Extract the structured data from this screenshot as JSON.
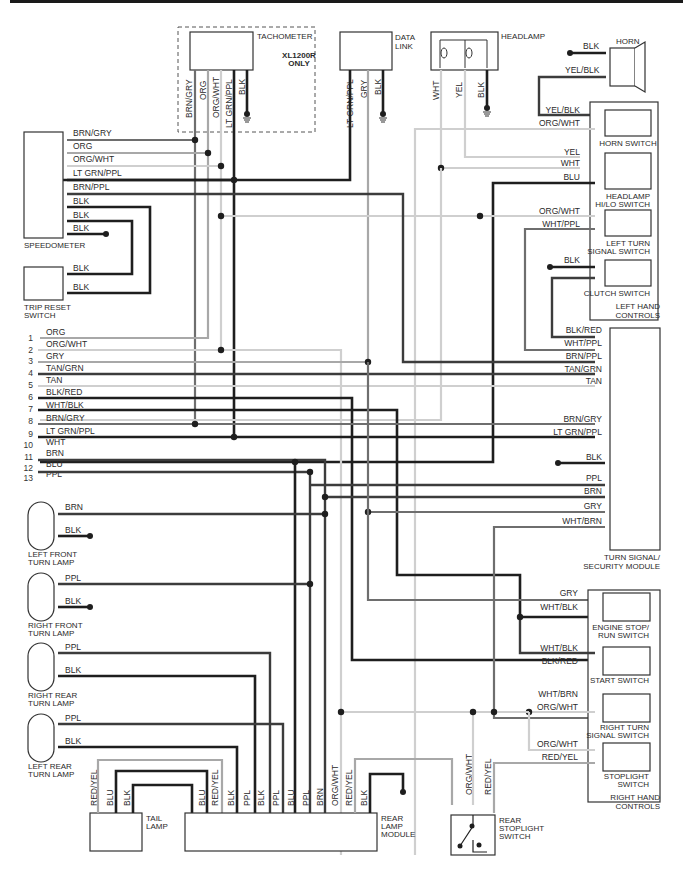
{
  "diagram": {
    "colors": {
      "black": "#1e1e1e",
      "dark": "#3c3c3c",
      "medium": "#6e6e6e",
      "light": "#a8a8a8",
      "xlight": "#cfcfcf"
    },
    "components": {
      "tachometer": "TACHOMETER",
      "xl_note_1": "XL1200R",
      "xl_note_2": "ONLY",
      "data_link_1": "DATA",
      "data_link_2": "LINK",
      "headlamp": "HEADLAMP",
      "horn": "HORN",
      "speedometer": "SPEEDOMETER",
      "trip_reset_1": "TRIP RESET",
      "trip_reset_2": "SWITCH",
      "horn_switch": "HORN SWITCH",
      "hilo_1": "HEADLAMP",
      "hilo_2": "HI/LO SWITCH",
      "left_turn_1": "LEFT TURN",
      "left_turn_2": "SIGNAL SWITCH",
      "clutch": "CLUTCH SWITCH",
      "lhc_1": "LEFT HAND",
      "lhc_2": "CONTROLS",
      "tssm_1": "TURN SIGNAL/",
      "tssm_2": "SECURITY MODULE",
      "engine_stop_1": "ENGINE STOP/",
      "engine_stop_2": "RUN SWITCH",
      "start": "START SWITCH",
      "right_turn_1": "RIGHT TURN",
      "right_turn_2": "SIGNAL SWITCH",
      "stoplight_1": "STOPLIGHT",
      "stoplight_2": "SWITCH",
      "rhc_1": "RIGHT HAND",
      "rhc_2": "CONTROLS",
      "lf_turn_1": "LEFT FRONT",
      "lf_turn_2": "TURN LAMP",
      "rf_turn_1": "RIGHT FRONT",
      "rf_turn_2": "TURN LAMP",
      "rr_turn_1": "RIGHT REAR",
      "rr_turn_2": "TURN LAMP",
      "lr_turn_1": "LEFT REAR",
      "lr_turn_2": "TURN LAMP",
      "tail_1": "TAIL",
      "tail_2": "LAMP",
      "rlm_1": "REAR",
      "rlm_2": "LAMP",
      "rlm_3": "MODULE",
      "rss_1": "REAR",
      "rss_2": "STOPLIGHT",
      "rss_3": "SWITCH"
    },
    "tachometer_pins": [
      "BRN/GRY",
      "ORG",
      "ORG/WHT",
      "LT GRN/PPL",
      "BLK"
    ],
    "data_link_pins": [
      "LT GRN/PPL",
      "GRY",
      "BLK"
    ],
    "headlamp_pins": [
      "WHT",
      "YEL",
      "BLK"
    ],
    "horn_pins": [
      "BLK",
      "YEL/BLK"
    ],
    "speedometer_wires": [
      "BRN/GRY",
      "ORG",
      "ORG/WHT",
      "LT GRN/PPL",
      "BRN/PPL",
      "BLK",
      "BLK",
      "BLK"
    ],
    "trip_reset_wires": [
      "BLK",
      "BLK"
    ],
    "left_hand_controls_wires": [
      "YEL/BLK",
      "ORG/WHT",
      "YEL",
      "WHT",
      "BLU",
      "ORG/WHT",
      "WHT/PPL",
      "BLK"
    ],
    "connector_rows": [
      {
        "num": "1",
        "color": "ORG"
      },
      {
        "num": "2",
        "color": "ORG/WHT"
      },
      {
        "num": "3",
        "color": "GRY"
      },
      {
        "num": "4",
        "color": "TAN/GRN"
      },
      {
        "num": "5",
        "color": "TAN"
      },
      {
        "num": "6",
        "color": "BLK/RED"
      },
      {
        "num": "7",
        "color": "WHT/BLK"
      },
      {
        "num": "8",
        "color": "BRN/GRY"
      },
      {
        "num": "9",
        "color": "LT GRN/PPL"
      },
      {
        "num": "10",
        "color": "WHT"
      },
      {
        "num": "11",
        "color": "BRN"
      },
      {
        "num": "12",
        "color": "BLU"
      },
      {
        "num": "13",
        "color": "PPL"
      }
    ],
    "tssm_wires": [
      "BLK/RED",
      "WHT/PPL",
      "BRN/PPL",
      "TAN/GRN",
      "TAN",
      "BRN/GRY",
      "LT GRN/PPL",
      "BLK",
      "PPL",
      "BRN",
      "GRY",
      "WHT/BRN"
    ],
    "right_hand_controls_wires": [
      "GRY",
      "WHT/BLK",
      "WHT/BLK",
      "BLK/RED",
      "WHT/BRN",
      "ORG/WHT",
      "ORG/WHT",
      "RED/YEL"
    ],
    "turn_lamp_wires": {
      "left_front": [
        "BRN",
        "BLK"
      ],
      "right_front": [
        "PPL",
        "BLK"
      ],
      "right_rear": [
        "PPL",
        "BLK"
      ],
      "left_rear": [
        "PPL",
        "BLK"
      ]
    },
    "tail_lamp_pins": [
      "RED/YEL",
      "BLU",
      "BLK"
    ],
    "rear_lamp_module_pins": [
      "BLU",
      "RED/YEL",
      "BLK",
      "PPL",
      "BLK",
      "PPL",
      "BLU",
      "PPL",
      "BRN",
      "ORG/WHT",
      "RED/YEL",
      "BLK"
    ],
    "rear_stoplight_pins": [
      "ORG/WHT",
      "RED/YEL"
    ]
  }
}
